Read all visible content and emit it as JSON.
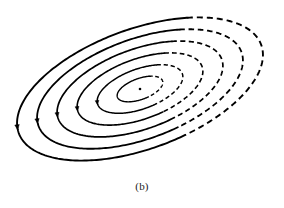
{
  "figure": {
    "caption": "(b)",
    "background_color": "#ffffff",
    "stroke_color": "#000000",
    "width": 284,
    "height": 208
  },
  "chart_data": {
    "type": "line",
    "title": "(b)",
    "subtitle": "",
    "xlabel": "",
    "ylabel": "",
    "grid": false,
    "legend": "none",
    "axes_shown": false,
    "xlim": [
      0,
      284
    ],
    "ylim": [
      0,
      208
    ],
    "center": {
      "x": 140,
      "y": 89,
      "label": "equilibrium-center",
      "marker": "dot",
      "radius": 1.3
    },
    "orbit_tilt_degrees": -20,
    "orbit_count": 6,
    "flow_direction": "counterclockwise",
    "style_note": "left and lower arcs drawn solid, right and upper-right arcs drawn dashed",
    "dash_pattern": "6 4",
    "series": [
      {
        "name": "orbit-1",
        "rx": 24,
        "ry": 10.5,
        "stroke_width": 1.4
      },
      {
        "name": "orbit-2",
        "rx": 45,
        "ry": 20.0,
        "stroke_width": 1.5
      },
      {
        "name": "orbit-3",
        "rx": 66,
        "ry": 30.0,
        "stroke_width": 1.6
      },
      {
        "name": "orbit-4",
        "rx": 87,
        "ry": 40.0,
        "stroke_width": 1.7
      },
      {
        "name": "orbit-5",
        "rx": 108,
        "ry": 50.0,
        "stroke_width": 1.8
      },
      {
        "name": "orbit-6",
        "rx": 129,
        "ry": 60.0,
        "stroke_width": 1.9
      }
    ],
    "arrows": [
      {
        "name": "flow-arrow-1",
        "orbit": "orbit-6",
        "angle_degrees": 186,
        "size": 5.0
      },
      {
        "name": "flow-arrow-2",
        "orbit": "orbit-5",
        "angle_degrees": 186,
        "size": 4.8
      },
      {
        "name": "flow-arrow-3",
        "orbit": "orbit-4",
        "angle_degrees": 186,
        "size": 4.6
      },
      {
        "name": "flow-arrow-4",
        "orbit": "orbit-3",
        "angle_degrees": 186,
        "size": 4.4
      },
      {
        "name": "flow-arrow-5",
        "orbit": "orbit-2",
        "angle_degrees": 186,
        "size": 4.2
      }
    ]
  }
}
